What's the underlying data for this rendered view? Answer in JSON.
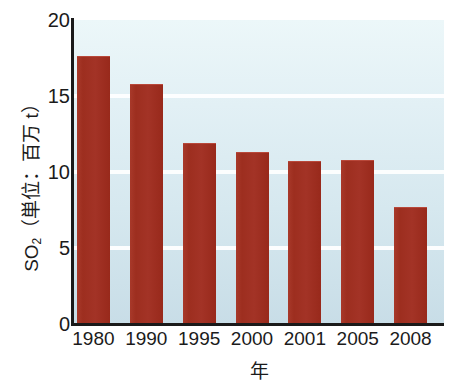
{
  "chart_data": {
    "type": "bar",
    "title": "",
    "subtitle": "",
    "categories": [
      "1980",
      "1990",
      "1995",
      "2000",
      "2001",
      "2005",
      "2008"
    ],
    "values": [
      17.6,
      15.8,
      11.9,
      11.3,
      10.7,
      10.8,
      7.7
    ],
    "xlabel": "年",
    "ylabel_text": "SO",
    "ylabel_sub": "2",
    "ylabel_rest": "（単位：百万 t）",
    "ylabel_full": "SO2（単位：百万 t）",
    "ylim": [
      0,
      20
    ],
    "yticks": [
      "20",
      "15",
      "10",
      "5",
      "0"
    ],
    "ytick_values": [
      20,
      15,
      10,
      5,
      0
    ],
    "grid": true,
    "grid_orientation": "horizontal",
    "gridline_values": [
      15,
      10,
      5
    ],
    "legend": null,
    "legend_position": "none",
    "series": [
      {
        "name": "SO2",
        "values": [
          17.6,
          15.8,
          11.9,
          11.3,
          10.7,
          10.8,
          7.7
        ]
      }
    ],
    "colors": {
      "bar": "#9e2f20",
      "bar_highlight": "#a8392a",
      "plot_background_top": "#ecf7f9",
      "plot_background_bottom": "#c8dde7",
      "gridline": "#ffffff",
      "axis": "#1a1a1a",
      "text": "#1b1b1b",
      "page_background": "#ffffff"
    }
  }
}
